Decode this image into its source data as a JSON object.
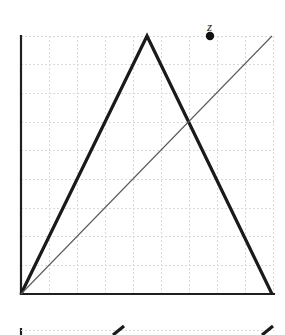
{
  "figure": {
    "title": "",
    "background_color": "#ffffff",
    "width": 285,
    "height": 335
  },
  "axes": {
    "y_axis": {
      "name": "y-axis",
      "color": "#1f1f1f",
      "stroke_width": 2.2,
      "x": 21,
      "y_top": 36,
      "y_bottom": 294
    },
    "x_axis": {
      "name": "x-axis",
      "color": "#1f1f1f",
      "stroke_width": 2.2,
      "y": 294,
      "x_left": 21,
      "x_right": 274
    }
  },
  "grid": {
    "visible": true,
    "color": "#d9d9d9",
    "stroke_width": 1,
    "dash": "2,2",
    "spacing": 28.1,
    "x_lines": [
      21,
      49.1,
      77.2,
      105.3,
      133.4,
      161.5,
      189.6,
      217.7,
      245.8,
      273.9
    ],
    "y_lines": [
      36,
      64.7,
      93.3,
      122,
      150.7,
      179.3,
      208,
      236.7,
      265.3,
      294
    ]
  },
  "chart_data": {
    "type": "line",
    "title": "",
    "xlabel": "",
    "ylabel": "",
    "xlim": [
      0,
      9
    ],
    "ylim": [
      0,
      9
    ],
    "grid": true,
    "legend": "none",
    "series": [
      {
        "name": "tent-function",
        "style": "thick",
        "color": "#1a1a1a",
        "stroke_width": 3.2,
        "x": [
          0,
          4.5,
          9
        ],
        "y": [
          0,
          9,
          0
        ],
        "points_px": [
          [
            21,
            294
          ],
          [
            147,
            36
          ],
          [
            272,
            294
          ]
        ]
      },
      {
        "name": "identity-line",
        "style": "thin",
        "color": "#5a5a5a",
        "stroke_width": 1.1,
        "x": [
          0,
          9
        ],
        "y": [
          0,
          9
        ],
        "points_px": [
          [
            21,
            294
          ],
          [
            272,
            36
          ]
        ]
      }
    ],
    "points": [
      {
        "name": "z",
        "label": "z",
        "x": 6.75,
        "y": 9,
        "px": [
          210,
          36
        ],
        "radius": 4.2,
        "color": "#111111",
        "label_offset": [
          -3,
          -16
        ]
      }
    ]
  },
  "next_figure_sliver": {
    "visible": true,
    "axis_color": "#1f1f1f",
    "grid_color": "#d9d9d9",
    "line_color": "#1a1a1a",
    "top_y": 328,
    "axis_x": 21,
    "x_right": 274,
    "gridline_y": 330,
    "strokes": [
      {
        "name": "left-rise-stub",
        "points_px": [
          [
            113,
            335
          ],
          [
            124,
            326
          ]
        ]
      },
      {
        "name": "right-rise-stub",
        "points_px": [
          [
            262,
            335
          ],
          [
            273,
            326
          ]
        ]
      }
    ]
  }
}
